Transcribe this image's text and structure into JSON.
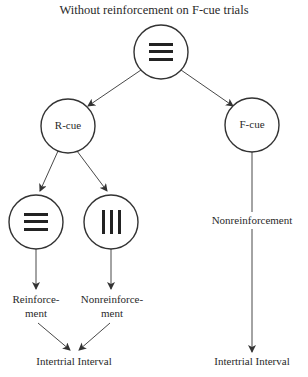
{
  "title": "Without reinforcement on F-cue trials",
  "nodes": {
    "top": {
      "icon": "horizontal-lines-stimulus"
    },
    "r_cue": {
      "label": "R-cue"
    },
    "f_cue": {
      "label": "F-cue"
    },
    "left_stim": {
      "icon": "horizontal-lines-stimulus"
    },
    "right_stim": {
      "icon": "vertical-lines-stimulus"
    }
  },
  "outcomes": {
    "reinforcement": {
      "line1": "Reinforce-",
      "line2": "ment"
    },
    "nonreinforcement_split": {
      "line1": "Nonreinforce-",
      "line2": "ment"
    },
    "nonreinforcement_f": "Nonreinforcement"
  },
  "iti": {
    "left": "Intertrial Interval",
    "right": "Intertrial Interval"
  },
  "colors": {
    "stroke": "#333333",
    "text": "#2a2a2a"
  }
}
